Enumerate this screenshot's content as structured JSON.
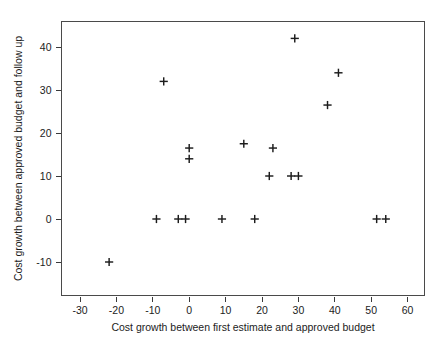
{
  "chart_data": {
    "type": "scatter",
    "title": "",
    "xlabel": "Cost growth between first estimate and approved budget",
    "ylabel": "Cost growth between approved budget and follow up",
    "xlim": [
      -35,
      65
    ],
    "ylim": [
      -14,
      45
    ],
    "xticks": [
      -30,
      -20,
      -10,
      0,
      10,
      20,
      30,
      40,
      50,
      60
    ],
    "yticks": [
      -10,
      0,
      10,
      20,
      30,
      40
    ],
    "xtick_labels": [
      "-30",
      "-20",
      "-10",
      "0",
      "10",
      "20",
      "30",
      "40",
      "50",
      "60"
    ],
    "ytick_labels": [
      "-10",
      "0",
      "10",
      "20",
      "30",
      "40"
    ],
    "grid": false,
    "legend": null,
    "marker": "plus",
    "marker_color": "#1c1c1c",
    "points": [
      {
        "x": -22,
        "y": -10
      },
      {
        "x": -9,
        "y": 0
      },
      {
        "x": -7,
        "y": 32
      },
      {
        "x": -3,
        "y": 0
      },
      {
        "x": -1,
        "y": 0
      },
      {
        "x": 0,
        "y": 16.5
      },
      {
        "x": 0,
        "y": 14
      },
      {
        "x": 9,
        "y": 0
      },
      {
        "x": 15,
        "y": 17.5
      },
      {
        "x": 18,
        "y": 0
      },
      {
        "x": 22,
        "y": 10
      },
      {
        "x": 23,
        "y": 16.5
      },
      {
        "x": 28,
        "y": 10
      },
      {
        "x": 29,
        "y": 42
      },
      {
        "x": 30,
        "y": 10
      },
      {
        "x": 38,
        "y": 26.5
      },
      {
        "x": 41,
        "y": 34
      },
      {
        "x": 51.5,
        "y": 0
      },
      {
        "x": 54,
        "y": 0
      }
    ]
  },
  "caption": {
    "text": ""
  }
}
